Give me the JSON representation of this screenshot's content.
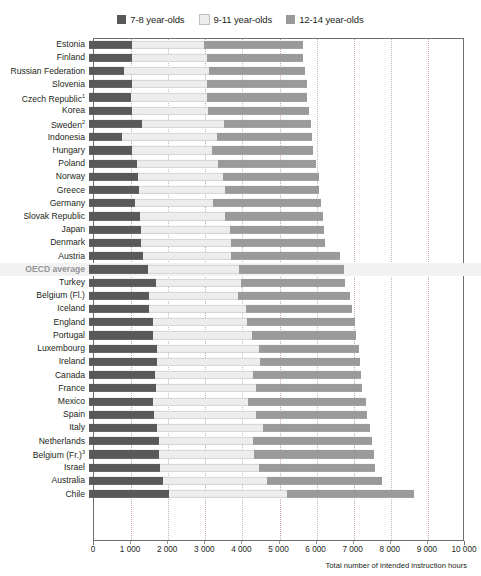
{
  "legend": {
    "items": [
      {
        "label": "7-8 year-olds",
        "color": "#595959",
        "icon": "legend-swatch-dark"
      },
      {
        "label": "9-11 year-olds",
        "color": "#ededed",
        "icon": "legend-swatch-light"
      },
      {
        "label": "12-14 year-olds",
        "color": "#9a9a9a",
        "icon": "legend-swatch-mid"
      }
    ]
  },
  "axis": {
    "title": "Total number of intended instruction hours",
    "ticks": [
      0,
      1000,
      2000,
      3000,
      4000,
      5000,
      6000,
      7000,
      8000,
      9000,
      10000
    ],
    "tick_labels": [
      "0",
      "1 000",
      "2 000",
      "3 000",
      "4 000",
      "5 000",
      "6 000",
      "7 000",
      "8 000",
      "9 000",
      "10 000"
    ],
    "min": 0,
    "max": 10000
  },
  "chart_data": {
    "type": "bar",
    "orientation": "horizontal",
    "stacked": true,
    "title": "",
    "xlabel": "Total number of intended instruction hours",
    "ylabel": "",
    "xlim": [
      0,
      10000
    ],
    "grid": true,
    "legend_position": "top-center",
    "series": [
      {
        "name": "7-8 year-olds",
        "color": "#595959"
      },
      {
        "name": "9-11 year-olds",
        "color": "#ededed"
      },
      {
        "name": "12-14 year-olds",
        "color": "#9a9a9a"
      }
    ],
    "categories": [
      "Estonia",
      "Finland",
      "Russian Federation",
      "Slovenia",
      "Czech Republic",
      "Korea",
      "Sweden",
      "Indonesia",
      "Hungary",
      "Poland",
      "Norway",
      "Greece",
      "Germany",
      "Slovak Republic",
      "Japan",
      "Denmark",
      "Austria",
      "OECD average",
      "Turkey",
      "Belgium (Fl.)",
      "Iceland",
      "England",
      "Portugal",
      "Luxembourg",
      "Ireland",
      "Canada",
      "France",
      "Mexico",
      "Spain",
      "Italy",
      "Netherlands",
      "Belgium (Fr.)",
      "Israel",
      "Australia",
      "Chile"
    ],
    "rows": [
      {
        "label": "Estonia",
        "note": "",
        "values": [
          1150,
          1960,
          2660
        ],
        "total": 5770,
        "highlight": false
      },
      {
        "label": "Finland",
        "note": "",
        "values": [
          1160,
          2010,
          2600
        ],
        "total": 5770,
        "highlight": false
      },
      {
        "label": "Russian Federation",
        "note": "",
        "values": [
          950,
          2280,
          2600
        ],
        "total": 5830,
        "highlight": false
      },
      {
        "label": "Slovenia",
        "note": "",
        "values": [
          1160,
          2020,
          2690
        ],
        "total": 5870,
        "highlight": false
      },
      {
        "label": "Czech Republic",
        "note": "1",
        "values": [
          1140,
          2050,
          2690
        ],
        "total": 5880,
        "highlight": false
      },
      {
        "label": "Korea",
        "note": "",
        "values": [
          1150,
          2050,
          2720
        ],
        "total": 5920,
        "highlight": false
      },
      {
        "label": "Sweden",
        "note": "2",
        "values": [
          1420,
          2230,
          2330
        ],
        "total": 5980,
        "highlight": false
      },
      {
        "label": "Indonesia",
        "note": "",
        "values": [
          880,
          2580,
          2560
        ],
        "total": 6020,
        "highlight": false
      },
      {
        "label": "Hungary",
        "note": "",
        "values": [
          1170,
          2140,
          2730
        ],
        "total": 6040,
        "highlight": false
      },
      {
        "label": "Poland",
        "note": "",
        "values": [
          1290,
          2180,
          2640
        ],
        "total": 6110,
        "highlight": false
      },
      {
        "label": "Norway",
        "note": "",
        "values": [
          1330,
          2290,
          2570
        ],
        "total": 6190,
        "highlight": false
      },
      {
        "label": "Greece",
        "note": "",
        "values": [
          1340,
          2320,
          2540
        ],
        "total": 6200,
        "highlight": false
      },
      {
        "label": "Germany",
        "note": "",
        "values": [
          1230,
          2110,
          2920
        ],
        "total": 6260,
        "highlight": false
      },
      {
        "label": "Slovak Republic",
        "note": "",
        "values": [
          1370,
          2290,
          2640
        ],
        "total": 6300,
        "highlight": false
      },
      {
        "label": "Japan",
        "note": "",
        "values": [
          1410,
          2400,
          2530
        ],
        "total": 6340,
        "highlight": false
      },
      {
        "label": "Denmark",
        "note": "",
        "values": [
          1390,
          2430,
          2550
        ],
        "total": 6370,
        "highlight": false
      },
      {
        "label": "Austria",
        "note": "",
        "values": [
          1450,
          2390,
          2920
        ],
        "total": 6760,
        "highlight": false
      },
      {
        "label": "OECD average",
        "note": "",
        "values": [
          1600,
          2450,
          2820
        ],
        "total": 6870,
        "highlight": true
      },
      {
        "label": "Turkey",
        "note": "",
        "values": [
          1800,
          2300,
          2800
        ],
        "total": 6900,
        "highlight": false
      },
      {
        "label": "Belgium (Fl.)",
        "note": "",
        "values": [
          1620,
          2390,
          3020
        ],
        "total": 7030,
        "highlight": false
      },
      {
        "label": "Iceland",
        "note": "",
        "values": [
          1610,
          2610,
          2870
        ],
        "total": 7090,
        "highlight": false
      },
      {
        "label": "England",
        "note": "",
        "values": [
          1720,
          2530,
          2910
        ],
        "total": 7160,
        "highlight": false
      },
      {
        "label": "Portugal",
        "note": "",
        "values": [
          1720,
          2670,
          2810
        ],
        "total": 7200,
        "highlight": false
      },
      {
        "label": "Luxembourg",
        "note": "",
        "values": [
          1830,
          2740,
          2700
        ],
        "total": 7270,
        "highlight": false
      },
      {
        "label": "Ireland",
        "note": "",
        "values": [
          1830,
          2770,
          2700
        ],
        "total": 7300,
        "highlight": false
      },
      {
        "label": "Canada",
        "note": "",
        "values": [
          1790,
          2640,
          2890
        ],
        "total": 7320,
        "highlight": false
      },
      {
        "label": "France",
        "note": "",
        "values": [
          1800,
          2700,
          2870
        ],
        "total": 7370,
        "highlight": false
      },
      {
        "label": "Mexico",
        "note": "",
        "values": [
          1720,
          2560,
          3180
        ],
        "total": 7460,
        "highlight": false
      },
      {
        "label": "Spain",
        "note": "",
        "values": [
          1760,
          2740,
          2990
        ],
        "total": 7490,
        "highlight": false
      },
      {
        "label": "Italy",
        "note": "",
        "values": [
          1840,
          2840,
          2890
        ],
        "total": 7570,
        "highlight": false
      },
      {
        "label": "Netherlands",
        "note": "",
        "values": [
          1880,
          2540,
          3200
        ],
        "total": 7620,
        "highlight": false
      },
      {
        "label": "Belgium (Fr.)",
        "note": "3",
        "values": [
          1880,
          2560,
          3240
        ],
        "total": 7680,
        "highlight": false
      },
      {
        "label": "Israel",
        "note": "",
        "values": [
          1910,
          2660,
          3140
        ],
        "total": 7710,
        "highlight": false
      },
      {
        "label": "Australia",
        "note": "",
        "values": [
          1990,
          2820,
          3090
        ],
        "total": 7900,
        "highlight": false
      },
      {
        "label": "Chile",
        "note": "",
        "values": [
          2160,
          3190,
          3400
        ],
        "total": 8750,
        "highlight": false
      }
    ]
  }
}
